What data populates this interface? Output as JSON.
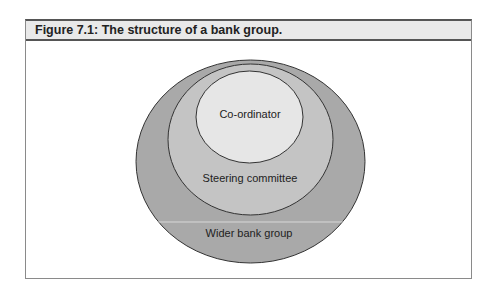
{
  "figure": {
    "title": "Figure 7.1: The structure of a bank group.",
    "colors": {
      "header_bg": "#e9e9e9",
      "outer_fill": "#a9a9a9",
      "middle_fill": "#c4c4c4",
      "inner_fill": "#e6e6e6",
      "stroke": "#333333"
    }
  },
  "diagram": {
    "layers": [
      {
        "label": "Co-ordinator",
        "level": "inner"
      },
      {
        "label": "Steering committee",
        "level": "middle"
      },
      {
        "label": "Wider bank group",
        "level": "outer"
      }
    ]
  }
}
